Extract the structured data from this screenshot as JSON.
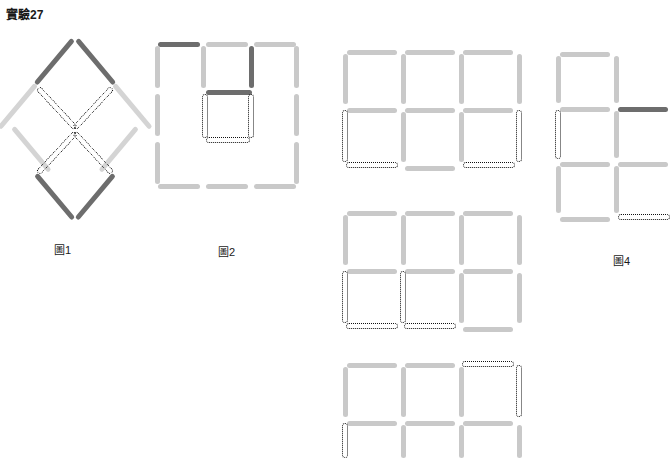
{
  "document": {
    "title": "實驗27",
    "type": "matchstick-puzzle-worksheet",
    "background_color": "#ffffff",
    "colors": {
      "stick_light": "#c9c9c9",
      "stick_lighter": "#d4d4d4",
      "stick_dark": "#6d6d6d",
      "dotted_outline": "#111111",
      "text": "#1a1a1a"
    }
  },
  "figures": [
    {
      "id": "figure-1",
      "label": "圖1",
      "shape": "rhombus-with-inner-x",
      "solid_sticks": 8,
      "dotted_sticks": 4,
      "description": "Diamond outline of eight matchsticks: two dark at the top apex, two light on the upper sides, two light on the lower sides, two dark at the bottom apex; four dotted matchsticks inside cross to form an X / bowtie."
    },
    {
      "id": "figure-2",
      "label": "圖2",
      "shape": "3x3-square-frame",
      "solid_sticks": 12,
      "dotted_sticks": 3,
      "description": "Large square frame three matches per side with a dark top-left match, a dark inner vertical match, a dark inner horizontal match, and a dotted U-shaped group of three matches inside."
    },
    {
      "id": "figure-3",
      "label": "",
      "shape": "3x2-grid",
      "solid_sticks": 13,
      "dotted_sticks": 4,
      "description": "Three-wide by two-tall grid of squares; the lower-left and lower-right corners are drawn with dotted matchsticks."
    },
    {
      "id": "figure-4",
      "label": "圖4",
      "shape": "1x3-column",
      "solid_sticks": 10,
      "dotted_sticks": 2,
      "description": "Vertical column of three squares, cropped at the right edge; a dark horizontal match juts right from the second row and a dotted match appears at the lower right."
    },
    {
      "id": "figure-5",
      "label": "",
      "shape": "3x2-grid",
      "solid_sticks": 13,
      "dotted_sticks": 5,
      "description": "Three-wide by two-tall grid of squares with a dotted group forming the lower-left two cells."
    },
    {
      "id": "figure-6",
      "label": "",
      "shape": "3x2-grid-cropped",
      "solid_sticks": 12,
      "dotted_sticks": 3,
      "description": "Three-wide grid cropped at the bottom of the page; the upper-right cell corner is drawn with dotted matchsticks."
    }
  ]
}
